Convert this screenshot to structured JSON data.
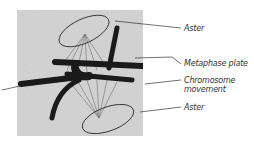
{
  "figure": {
    "labels": [
      {
        "id": "aster-top",
        "text": "Aster"
      },
      {
        "id": "metaphase-plate",
        "text": "Metaphase plate"
      },
      {
        "id": "chromosome-movement-1",
        "text": "Chromosome"
      },
      {
        "id": "chromosome-movement-2",
        "text": "movement"
      },
      {
        "id": "aster-bottom",
        "text": "Aster"
      }
    ]
  }
}
